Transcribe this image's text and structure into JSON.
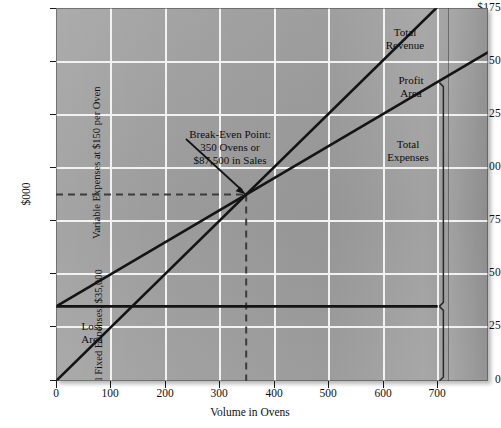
{
  "chart_data": {
    "type": "line",
    "title": "",
    "xlabel": "Volume in Ovens",
    "ylabel": "$000",
    "xlim": [
      0,
      795
    ],
    "ylim": [
      0,
      175
    ],
    "xticks": [
      0,
      100,
      200,
      300,
      400,
      500,
      600,
      700
    ],
    "yticks": [
      0,
      25,
      50,
      75,
      100,
      125,
      150,
      175
    ],
    "ytick_labels": [
      "0",
      "25",
      "50",
      "75",
      "100",
      "125",
      "150",
      "$175"
    ],
    "grid": true,
    "legend": "inline-annotations",
    "series": [
      {
        "name": "Total Revenue",
        "x": [
          0,
          700
        ],
        "values": [
          0,
          175
        ],
        "note": "$250 per oven"
      },
      {
        "name": "Total Expenses",
        "x": [
          0,
          700
        ],
        "values": [
          35,
          140
        ],
        "note": "$35,000 fixed plus $150 per oven"
      },
      {
        "name": "Total Fixed Expenses",
        "x": [
          0,
          700
        ],
        "values": [
          35,
          35
        ],
        "note": "$35,000 constant"
      }
    ],
    "annotations": [
      {
        "name": "break-even-note",
        "text": "Break-Even Point: 350 Ovens or $87,500 in Sales",
        "x": 350,
        "y": 87.5
      },
      {
        "name": "profit-area",
        "text": "Profit Area"
      },
      {
        "name": "loss-area",
        "text": "Loss Area"
      },
      {
        "name": "variable-expenses-bracket",
        "text": "Variable Expenses at $150 per Oven",
        "y_range": [
          35,
          140
        ]
      },
      {
        "name": "fixed-expenses-bracket",
        "text": "Total Fixed Expenses, $35,000",
        "y_range": [
          0,
          35
        ]
      }
    ],
    "break_even": {
      "units": 350,
      "sales": 87500
    }
  },
  "axes": {
    "y_title": "$000",
    "x_title": "Volume in Ovens",
    "y_labels": [
      "$175",
      "150",
      "125",
      "100",
      "75",
      "50",
      "25",
      "0"
    ],
    "x_labels": [
      "0",
      "100",
      "200",
      "300",
      "400",
      "500",
      "600",
      "700"
    ]
  },
  "annotations": {
    "break_even": {
      "line1": "Break-Even Point:",
      "line2": "350 Ovens or",
      "line3": "$87,500 in Sales"
    },
    "total_revenue": {
      "line1": "Total",
      "line2": "Revenue"
    },
    "profit_area": {
      "line1": "Profit",
      "line2": "Area"
    },
    "total_expenses": {
      "line1": "Total",
      "line2": "Expenses"
    },
    "loss_area": {
      "line1": "Loss",
      "line2": "Area"
    },
    "variable_bracket": "Variable Expenses at $150 per Oven",
    "fixed_bracket": "Total Fixed Expenses, $35,000"
  },
  "colors": {
    "plot_background": "#9d9d9d",
    "gridline": "#f2f2f2",
    "data_line": "#141414",
    "dashed_guide": "#4a4a4a",
    "text": "#111111"
  }
}
